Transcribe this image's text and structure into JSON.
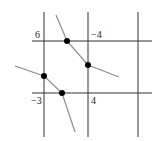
{
  "diagram": {
    "labels": {
      "top_left": "6",
      "top_right": "−4",
      "bottom_left": "−3",
      "bottom_right": "4"
    },
    "colors": {
      "grid": "#333333",
      "curve": "#8c8c8c",
      "dot": "#000000"
    },
    "curves": [
      {
        "name": "upper-curve",
        "points_marked": 2
      },
      {
        "name": "lower-curve",
        "points_marked": 2
      }
    ]
  }
}
